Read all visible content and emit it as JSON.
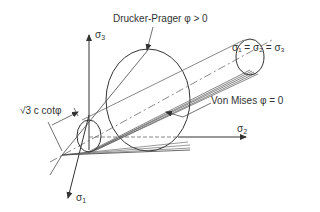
{
  "diagram": {
    "labels": {
      "drucker_prager": "Drucker-Prager φ > 0",
      "von_mises": "Von Mises φ = 0",
      "hydrostatic_axis": "σ₁ = σ₂ = σ₃",
      "apex_distance": "√3 c cotφ"
    },
    "axes": {
      "sigma1": {
        "symbol": "σ",
        "sub": "1"
      },
      "sigma2": {
        "symbol": "σ",
        "sub": "2"
      },
      "sigma3": {
        "symbol": "σ",
        "sub": "3"
      }
    },
    "colors": {
      "line": "#333333",
      "background": "#ffffff"
    }
  }
}
